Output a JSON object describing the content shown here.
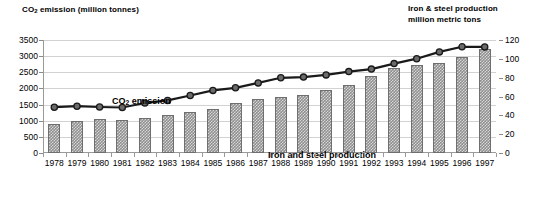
{
  "chart_data": {
    "type": "bar",
    "title": "",
    "xlabel": "",
    "grid": true,
    "legend_position": "inline-annotation",
    "categories": [
      "1978",
      "1979",
      "1980",
      "1981",
      "1982",
      "1983",
      "1984",
      "1985",
      "1986",
      "1987",
      "1988",
      "1989",
      "1990",
      "1991",
      "1992",
      "1993",
      "1994",
      "1995",
      "1996",
      "1997"
    ],
    "left_axis": {
      "label": "CO₂ emission (million tonnes)",
      "ylim": [
        0,
        3500
      ],
      "ticks": [
        0,
        500,
        1000,
        1500,
        2000,
        2500,
        3000,
        3500
      ],
      "tick_labels": [
        "0",
        "500",
        "1000",
        "1500",
        "2000",
        "2500",
        "3000",
        "3500"
      ]
    },
    "right_axis": {
      "label": "Iron & steel production\nmillion  metric tons",
      "label_line1": "Iron & steel production",
      "label_line2": "million  metric tons",
      "ylim": [
        0,
        120
      ],
      "ticks": [
        0,
        20,
        40,
        60,
        80,
        100,
        120
      ],
      "tick_labels": [
        "0",
        "20",
        "40",
        "60",
        "80",
        "100",
        "120"
      ]
    },
    "series": [
      {
        "name": "Iron and steel production",
        "annotation": "Iron and steel production",
        "type": "bar",
        "axis": "right",
        "unit": "million metric tons",
        "color": "#8f8f8f",
        "values": [
          31,
          34,
          36,
          35,
          37,
          40,
          44,
          47,
          53,
          57,
          60,
          62,
          67,
          72,
          82,
          90,
          93,
          96,
          102,
          110
        ]
      },
      {
        "name": "CO₂ emission",
        "annotation": "CO₂  emission",
        "type": "line",
        "axis": "left",
        "unit": "million tonnes",
        "color": "#1a1a1a",
        "marker": "circle",
        "values": [
          1420,
          1450,
          1425,
          1410,
          1550,
          1630,
          1780,
          1940,
          2020,
          2170,
          2330,
          2350,
          2420,
          2520,
          2600,
          2770,
          2920,
          3130,
          3290,
          3285
        ]
      }
    ]
  }
}
